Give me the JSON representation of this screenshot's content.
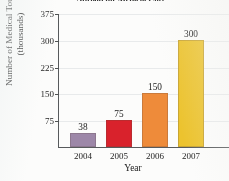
{
  "chart_data": {
    "type": "bar",
    "title": "Abroad for Medical Care",
    "xlabel": "Year",
    "ylabel": "Number of Medical Tourists (thousands)",
    "ylabel_lines": [
      "Number of Medical Tourists",
      "(thousands)"
    ],
    "categories": [
      "2004",
      "2005",
      "2006",
      "2007"
    ],
    "values": [
      38,
      75,
      150,
      300
    ],
    "value_labels": [
      "38",
      "75",
      "150",
      "300"
    ],
    "yticks": [
      75,
      150,
      225,
      300,
      375
    ],
    "ytick_labels": [
      "75",
      "150",
      "225",
      "300",
      "375"
    ],
    "ylim": [
      0,
      375
    ],
    "grid": true,
    "legend": null,
    "bar_colors": [
      "#9c86a8",
      "#da1f29",
      "#ef8a37",
      "#edc32b"
    ]
  }
}
